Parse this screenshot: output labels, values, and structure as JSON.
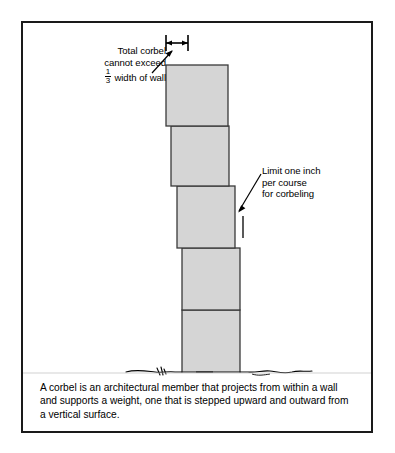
{
  "figure": {
    "background_color": "#ffffff",
    "border_color": "#1a1a1a",
    "block_fill_color": "#d5d5d5",
    "block_stroke_color": "#3a3a3a",
    "line_color": "#000000"
  },
  "annotations": {
    "total_corbel": {
      "line1": "Total corbel",
      "line2": "cannot exceed",
      "fraction_numerator": "1",
      "fraction_denominator": "3",
      "line3_suffix": " width of wall",
      "full_text": "Total corbel cannot exceed 1/3 width of wall"
    },
    "limit_one_inch": {
      "line1": "Limit one inch",
      "line2": "per course",
      "line3": "for corbeling",
      "full_text": "Limit one inch per course for corbeling"
    }
  },
  "caption": {
    "text": "A corbel is an architectural member that projects from within a wall and supports a weight, one that is stepped upward and outward from a vertical surface."
  },
  "diagram": {
    "type": "technical-illustration",
    "course_count": 5,
    "ground_line": "irregular hatched grade line",
    "dimension_bar": "total corbel projection width indicator at top"
  }
}
